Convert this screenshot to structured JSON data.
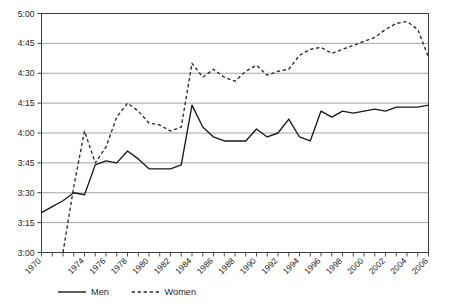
{
  "chart_data": {
    "type": "line",
    "title": "",
    "xlabel": "",
    "ylabel": "",
    "y_tick_labels": [
      "5:00",
      "4:45",
      "4:30",
      "4:15",
      "4:00",
      "3:45",
      "3:30",
      "3:15",
      "3:00"
    ],
    "y_tick_minutes": [
      300,
      285,
      270,
      255,
      240,
      225,
      210,
      195,
      180
    ],
    "ylim_minutes": [
      180,
      300
    ],
    "grid": true,
    "legend_position": "bottom",
    "x_tick_labels": [
      "1970",
      "1974",
      "1976",
      "1978",
      "1980",
      "1982",
      "1984",
      "1986",
      "1988",
      "1990",
      "1992",
      "1994",
      "1996",
      "1998",
      "2000",
      "2002",
      "2004",
      "2006"
    ],
    "x_all_years": [
      1970,
      1971,
      1972,
      1973,
      1974,
      1975,
      1976,
      1977,
      1978,
      1979,
      1980,
      1981,
      1982,
      1983,
      1984,
      1985,
      1986,
      1987,
      1988,
      1989,
      1990,
      1991,
      1992,
      1993,
      1994,
      1995,
      1996,
      1997,
      1998,
      1999,
      2000,
      2001,
      2002,
      2003,
      2004,
      2005,
      2006
    ],
    "xlim": [
      1970,
      2006
    ],
    "series": [
      {
        "name": "Men",
        "style": "solid",
        "color": "#1a1a1a",
        "x": [
          1970,
          1971,
          1972,
          1973,
          1974,
          1975,
          1976,
          1977,
          1978,
          1979,
          1980,
          1981,
          1982,
          1983,
          1984,
          1985,
          1986,
          1987,
          1988,
          1989,
          1990,
          1991,
          1992,
          1993,
          1994,
          1995,
          1996,
          1997,
          1998,
          1999,
          2000,
          2001,
          2002,
          2003,
          2004,
          2005,
          2006
        ],
        "values_minutes": [
          200,
          203,
          206,
          210,
          209,
          224,
          226,
          225,
          231,
          227,
          222,
          222,
          222,
          224,
          254,
          243,
          238,
          236,
          236,
          236,
          242,
          238,
          240,
          247,
          238,
          236,
          251,
          248,
          251,
          250,
          251,
          252,
          251,
          253,
          253,
          253,
          254
        ],
        "values_labels": [
          "3:20",
          "3:23",
          "3:26",
          "3:30",
          "3:29",
          "3:44",
          "3:46",
          "3:45",
          "3:51",
          "3:47",
          "3:42",
          "3:42",
          "3:42",
          "3:44",
          "4:14",
          "4:03",
          "3:58",
          "3:56",
          "3:56",
          "3:56",
          "4:02",
          "3:58",
          "4:00",
          "4:07",
          "3:58",
          "3:56",
          "4:11",
          "4:08",
          "4:11",
          "4:10",
          "4:11",
          "4:12",
          "4:11",
          "4:13",
          "4:13",
          "4:13",
          "4:14"
        ]
      },
      {
        "name": "Women",
        "style": "dashed",
        "color": "#2b2b2b",
        "x": [
          1972,
          1973,
          1974,
          1975,
          1976,
          1977,
          1978,
          1979,
          1980,
          1981,
          1982,
          1983,
          1984,
          1985,
          1986,
          1987,
          1988,
          1989,
          1990,
          1991,
          1992,
          1993,
          1994,
          1995,
          1996,
          1997,
          1998,
          1999,
          2000,
          2001,
          2002,
          2003,
          2004,
          2005,
          2006
        ],
        "values_minutes": [
          180,
          213,
          241,
          225,
          233,
          248,
          255,
          251,
          245,
          244,
          241,
          243,
          275,
          268,
          272,
          268,
          266,
          271,
          274,
          269,
          271,
          272,
          279,
          282,
          283,
          280,
          282,
          284,
          286,
          288,
          292,
          295,
          296,
          292,
          278
        ],
        "values_labels": [
          "3:00",
          "3:33",
          "4:01",
          "3:45",
          "3:53",
          "4:08",
          "4:15",
          "4:11",
          "4:05",
          "4:04",
          "4:01",
          "4:03",
          "4:35",
          "4:28",
          "4:32",
          "4:28",
          "4:26",
          "4:31",
          "4:34",
          "4:29",
          "4:31",
          "4:32",
          "4:39",
          "4:42",
          "4:43",
          "4:40",
          "4:42",
          "4:44",
          "4:46",
          "4:48",
          "4:52",
          "4:55",
          "4:56",
          "4:52",
          "4:38"
        ]
      }
    ]
  },
  "legend": {
    "items": [
      {
        "label": "Men",
        "style": "solid"
      },
      {
        "label": "Women",
        "style": "dashed"
      }
    ]
  },
  "colors": {
    "background": "#ffffff",
    "grid": "#9a9a9a",
    "axis": "#3c3c3c",
    "men_line": "#1a1a1a",
    "women_line": "#2b2b2b",
    "text": "#262626"
  }
}
